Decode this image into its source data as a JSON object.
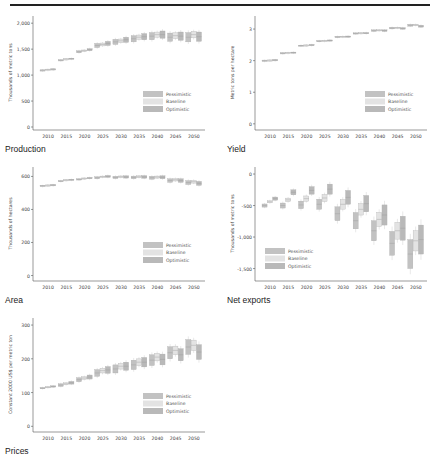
{
  "figure": {
    "has_top_rule": true
  },
  "legend": [
    {
      "label": "Pessimistic",
      "color": "#c2c2c2"
    },
    {
      "label": "Baseline",
      "color": "#e3e3e3"
    },
    {
      "label": "Optimistic",
      "color": "#b9b9b9"
    }
  ],
  "chart_data": [
    {
      "id": "production",
      "type": "box",
      "title": "Production",
      "ylabel": "Thousands of metric tons",
      "xlabel": "",
      "ylim": [
        0,
        2100
      ],
      "yticks": [
        0,
        500,
        1000,
        1500,
        2000
      ],
      "ytick_labels": [
        "0",
        "500",
        "1,000",
        "1,500",
        "2,000"
      ],
      "categories": [
        "2010",
        "2015",
        "2020",
        "2025",
        "2030",
        "2035",
        "2040",
        "2045",
        "2050"
      ],
      "legend_position": "lower-right",
      "series": [
        {
          "name": "Pessimistic",
          "values": [
            1100,
            1290,
            1450,
            1570,
            1640,
            1700,
            1750,
            1730,
            1730
          ]
        },
        {
          "name": "Baseline",
          "values": [
            1110,
            1310,
            1470,
            1590,
            1660,
            1730,
            1780,
            1760,
            1780
          ]
        },
        {
          "name": "Optimistic",
          "values": [
            1120,
            1320,
            1490,
            1610,
            1680,
            1740,
            1780,
            1750,
            1740
          ]
        }
      ],
      "spread": [
        0,
        5,
        20,
        40,
        50,
        60,
        70,
        80,
        90
      ]
    },
    {
      "id": "yield",
      "type": "box",
      "title": "Yield",
      "ylabel": "Metric tons per hectare",
      "xlabel": "",
      "ylim": [
        -0.1,
        3.35
      ],
      "yticks": [
        0,
        1,
        2,
        3
      ],
      "ytick_labels": [
        "0",
        "1",
        "2",
        "3"
      ],
      "categories": [
        "2010",
        "2015",
        "2020",
        "2025",
        "2030",
        "2035",
        "2040",
        "2045",
        "2050"
      ],
      "legend_position": "lower-right",
      "series": [
        {
          "name": "Pessimistic",
          "values": [
            2.01,
            2.24,
            2.48,
            2.62,
            2.75,
            2.86,
            2.95,
            3.03,
            3.12
          ]
        },
        {
          "name": "Baseline",
          "values": [
            2.02,
            2.25,
            2.49,
            2.63,
            2.76,
            2.87,
            2.96,
            3.04,
            3.13
          ]
        },
        {
          "name": "Optimistic",
          "values": [
            2.03,
            2.26,
            2.5,
            2.64,
            2.76,
            2.87,
            2.95,
            3.02,
            3.09
          ]
        }
      ],
      "spread": [
        0,
        0.01,
        0.01,
        0.015,
        0.02,
        0.02,
        0.025,
        0.025,
        0.03
      ]
    },
    {
      "id": "area",
      "type": "box",
      "title": "Area",
      "ylabel": "Thousands of hectares",
      "xlabel": "",
      "ylim": [
        -15,
        645
      ],
      "yticks": [
        0,
        200,
        400,
        600
      ],
      "ytick_labels": [
        "0",
        "200",
        "400",
        "600"
      ],
      "categories": [
        "2010",
        "2015",
        "2020",
        "2025",
        "2030",
        "2035",
        "2040",
        "2045",
        "2050"
      ],
      "legend_position": "lower-right",
      "series": [
        {
          "name": "Pessimistic",
          "values": [
            545,
            572,
            582,
            592,
            594,
            594,
            592,
            575,
            563
          ]
        },
        {
          "name": "Baseline",
          "values": [
            548,
            578,
            588,
            598,
            598,
            598,
            596,
            580,
            568
          ]
        },
        {
          "name": "Optimistic",
          "values": [
            550,
            580,
            590,
            600,
            597,
            597,
            595,
            575,
            558
          ]
        }
      ],
      "spread": [
        0,
        3,
        4,
        6,
        7,
        8,
        9,
        11,
        12
      ]
    },
    {
      "id": "net_exports",
      "type": "box",
      "title": "Net exports",
      "ylabel": "Thousands of metric tons",
      "xlabel": "",
      "ylim": [
        -1650,
        80
      ],
      "yticks": [
        -1500,
        -1000,
        -500,
        0
      ],
      "ytick_labels": [
        "-1,500",
        "-1,000",
        "-500",
        "0"
      ],
      "categories": [
        "2010",
        "2015",
        "2020",
        "2025",
        "2030",
        "2035",
        "2040",
        "2045",
        "2050"
      ],
      "legend_position": "lower-left",
      "series": [
        {
          "name": "Pessimistic",
          "values": [
            -500,
            -500,
            -490,
            -480,
            -630,
            -740,
            -900,
            -1100,
            -1270
          ]
        },
        {
          "name": "Baseline",
          "values": [
            -440,
            -410,
            -390,
            -380,
            -480,
            -560,
            -720,
            -900,
            -1060
          ]
        },
        {
          "name": "Optimistic",
          "values": [
            -390,
            -290,
            -260,
            -240,
            -370,
            -470,
            -650,
            -860,
            -1040
          ]
        }
      ],
      "spread": [
        25,
        40,
        60,
        80,
        110,
        130,
        160,
        190,
        230
      ]
    },
    {
      "id": "prices",
      "type": "box",
      "title": "Prices",
      "ylabel": "Constant 2000 US$ per metric ton",
      "xlabel": "",
      "ylim": [
        -8,
        315
      ],
      "yticks": [
        0,
        100,
        200,
        300
      ],
      "ytick_labels": [
        "0",
        "100",
        "200",
        "300"
      ],
      "categories": [
        "2010",
        "2015",
        "2020",
        "2025",
        "2030",
        "2035",
        "2040",
        "2045",
        "2050"
      ],
      "legend_position": "lower-right",
      "series": [
        {
          "name": "Pessimistic",
          "values": [
            113,
            122,
            138,
            158,
            170,
            182,
            196,
            218,
            235
          ]
        },
        {
          "name": "Baseline",
          "values": [
            116,
            126,
            143,
            165,
            178,
            190,
            205,
            225,
            240
          ]
        },
        {
          "name": "Optimistic",
          "values": [
            118,
            129,
            146,
            167,
            178,
            190,
            198,
            212,
            220
          ]
        }
      ],
      "spread": [
        2,
        4,
        6,
        10,
        12,
        14,
        16,
        18,
        22
      ]
    }
  ]
}
